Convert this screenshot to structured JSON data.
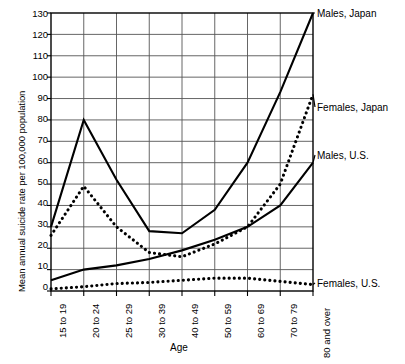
{
  "chart_data": {
    "type": "line",
    "title": "",
    "xlabel": "Age",
    "ylabel": "Mean annual suicide rate per 100,000 population",
    "categories": [
      "15 to 19",
      "20 to 24",
      "25 to 29",
      "30 to 39",
      "40 to 49",
      "50 to 59",
      "60 to 69",
      "70 to 79",
      "80 and over"
    ],
    "ylim": [
      0,
      130
    ],
    "yticks": [
      0,
      10,
      20,
      30,
      40,
      50,
      60,
      70,
      80,
      90,
      100,
      110,
      120,
      130
    ],
    "grid": true,
    "legend_position": "right-inline-labels",
    "series": [
      {
        "name": "Males, Japan",
        "style": "solid",
        "color": "#000000",
        "values": [
          30,
          80,
          52,
          28,
          27,
          38,
          60,
          93,
          130
        ]
      },
      {
        "name": "Females, Japan",
        "style": "dotted",
        "color": "#000000",
        "values": [
          26,
          49,
          30,
          18,
          16,
          22,
          30,
          50,
          92
        ]
      },
      {
        "name": "Males, U.S.",
        "style": "solid",
        "color": "#000000",
        "values": [
          5,
          10,
          12,
          15,
          19,
          24,
          30,
          40,
          60
        ]
      },
      {
        "name": "Females, U.S.",
        "style": "dotted",
        "color": "#000000",
        "values": [
          1,
          2,
          3.5,
          4,
          5,
          6,
          6,
          4.5,
          3
        ]
      }
    ]
  },
  "axis": {
    "y_title": "Mean annual suicide rate per 100,000 population",
    "x_title": "Age",
    "y_tick_labels": [
      "130",
      "120",
      "110",
      "100",
      "90",
      "80",
      "70",
      "60",
      "50",
      "40",
      "30",
      "20",
      "10",
      "0"
    ],
    "x_tick_labels": [
      "15 to 19",
      "20 to 24",
      "25 to 29",
      "30 to 39",
      "40 to 49",
      "50 to 59",
      "60 to 69",
      "70 to 79",
      "80 and over"
    ]
  },
  "series_labels": {
    "males_japan": "Males, Japan",
    "females_japan": "Females, Japan",
    "males_us": "Males, U.S.",
    "females_us": "Females, U.S."
  },
  "colors": {
    "ink": "#000000",
    "grid": "#555555",
    "background": "#ffffff"
  }
}
